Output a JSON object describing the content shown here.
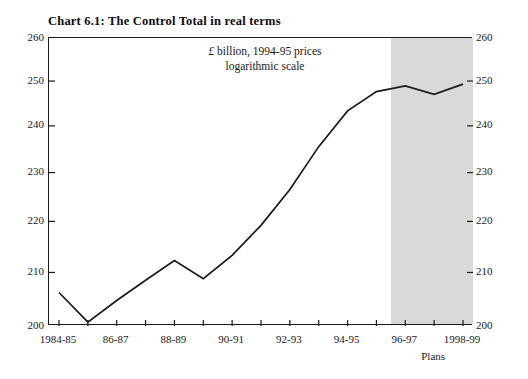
{
  "title": "Chart 6.1: The Control Total in real terms",
  "annotation": {
    "line1_currency": "£",
    "line1_rest": " billion, 1994-95 prices",
    "line2": "logarithmic scale"
  },
  "plans_label": "Plans",
  "colors": {
    "line": "#1a1a1a",
    "frame": "#1a1a1a",
    "forecast_band": "#d9d9d9",
    "background": "#ffffff",
    "text": "#1a1a1a"
  },
  "chart_data": {
    "type": "line",
    "title": "Chart 6.1: The Control Total in real terms",
    "subtitle": "£ billion, 1994-95 prices / logarithmic scale",
    "xlabel": "",
    "ylabel": "",
    "yscale": "log",
    "ylim": [
      200,
      260
    ],
    "yticks": [
      200,
      210,
      220,
      230,
      240,
      250,
      260
    ],
    "ytick_labels": [
      "200",
      "210",
      "220",
      "230",
      "240",
      "250",
      "260"
    ],
    "ytick_labels_right": [
      "200",
      "210",
      "220",
      "230",
      "240",
      "250",
      "260"
    ],
    "grid": false,
    "legend": "none",
    "categories": [
      "1984-85",
      "1985-86",
      "1986-87",
      "1987-88",
      "1988-89",
      "1989-90",
      "1990-91",
      "1991-92",
      "1992-93",
      "1993-94",
      "1994-95",
      "1995-96",
      "1996-97",
      "1997-98",
      "1998-99"
    ],
    "xtick_labels": [
      "1984-85",
      "",
      "86-87",
      "",
      "88-89",
      "",
      "90-91",
      "",
      "92-93",
      "",
      "94-95",
      "",
      "96-97",
      "",
      "1998-99"
    ],
    "values": [
      206.2,
      200.7,
      204.7,
      208.5,
      212.3,
      208.8,
      213.3,
      219.2,
      226.5,
      235.5,
      243.3,
      247.6,
      248.9,
      247.0,
      249.3
    ],
    "series": [
      {
        "name": "Control Total (real terms)",
        "values": [
          206.2,
          200.7,
          204.7,
          208.5,
          212.3,
          208.8,
          213.3,
          219.2,
          226.5,
          235.5,
          243.3,
          247.6,
          248.9,
          247.0,
          249.3
        ]
      }
    ],
    "forecast_region": {
      "label": "Plans",
      "start_category": "1996-97",
      "end_category": "1998-99",
      "shaded": true
    },
    "annotations": [
      {
        "text": "£ billion, 1994-95 prices",
        "position": "inside-top-center"
      },
      {
        "text": "logarithmic scale",
        "position": "inside-top-center"
      },
      {
        "text": "Plans",
        "position": "below-axis-right"
      }
    ]
  }
}
